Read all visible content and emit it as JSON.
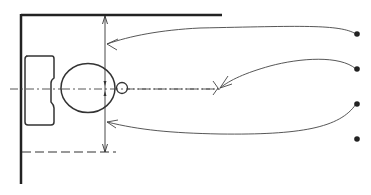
{
  "diagram": {
    "colors": {
      "ink": "#2a2a2a",
      "background": "#ffffff"
    },
    "elements": {
      "wall_top": "wall-line",
      "wall_left": "wall-line",
      "cistern": "tank",
      "bowl": "toilet-bowl",
      "outlet": "flange-circle",
      "centerline": "axis",
      "clearance_dimension": "vertical-dimension",
      "front_limit": "dashed-line"
    },
    "callouts": [
      {
        "id": 1,
        "label": ""
      },
      {
        "id": 2,
        "label": ""
      },
      {
        "id": 3,
        "label": ""
      },
      {
        "id": 4,
        "label": ""
      }
    ]
  }
}
